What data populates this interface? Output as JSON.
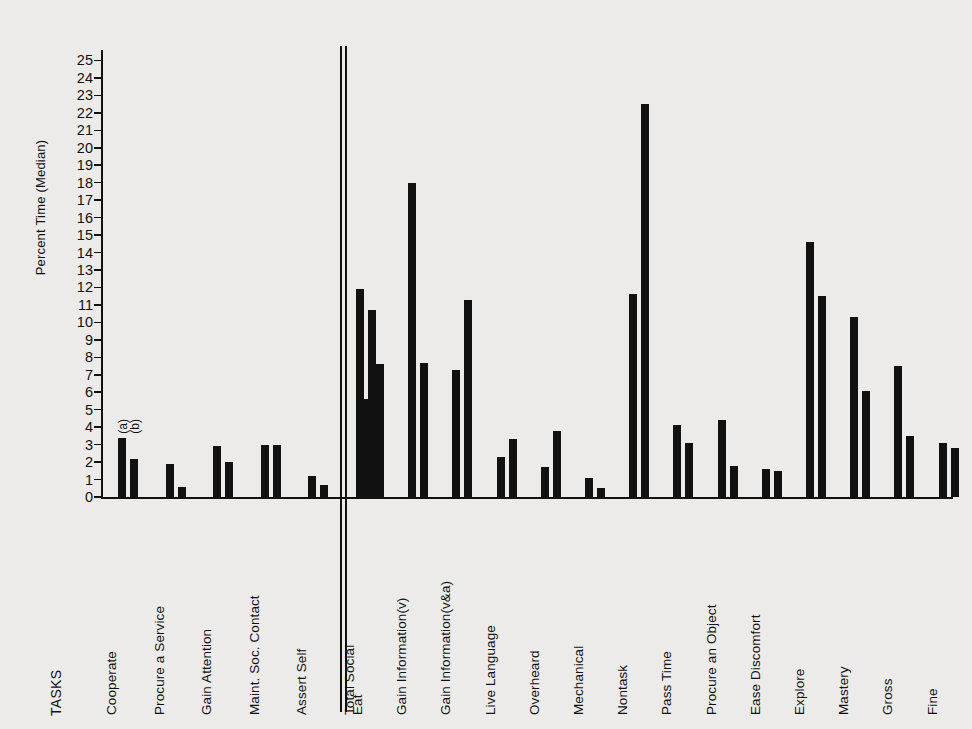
{
  "chart_data": {
    "type": "bar",
    "title": "",
    "xlabel": "TASKS",
    "ylabel": "Percent Time (Median)",
    "ylim": [
      0,
      25.6
    ],
    "ytick_labels": [
      "0",
      "1",
      "2",
      "3",
      "4",
      "5",
      "6",
      "7",
      "8",
      "9",
      "10",
      "11",
      "12",
      "13",
      "14",
      "15",
      "16",
      "17",
      "18",
      "19",
      "20",
      "21",
      "22",
      "23",
      "24",
      "25"
    ],
    "ytick_values": [
      0,
      1,
      2,
      3,
      4,
      5,
      6,
      7,
      8,
      9,
      10,
      11,
      12,
      13,
      14,
      15,
      16,
      17,
      18,
      19,
      20,
      21,
      22,
      23,
      24,
      25
    ],
    "grid": false,
    "legend_position": "inline-above-first-group",
    "series_markers": [
      "(a)",
      "(b)"
    ],
    "categories": [
      "Cooperate",
      "Procure a Service",
      "Gain Attention",
      "Maint. Soc. Contact",
      "Assert Self",
      "Total Social",
      "Eat",
      "Gain Information(v)",
      "Gain Information(v&a)",
      "Live Language",
      "Overheard",
      "Mechanical",
      "Nontask",
      "Pass Time",
      "Procure an Object",
      "Ease Discomfort",
      "Explore",
      "Mastery",
      "Gross",
      "Fine"
    ],
    "series": [
      {
        "name": "(a)",
        "values": [
          3.4,
          1.9,
          2.9,
          3.0,
          1.2,
          11.9,
          5.6,
          18.0,
          7.3,
          2.3,
          1.7,
          1.1,
          11.6,
          4.1,
          4.4,
          1.6,
          14.6,
          10.3,
          7.5,
          3.1
        ]
      },
      {
        "name": "(b)",
        "values": [
          2.2,
          0.6,
          2.0,
          3.0,
          0.7,
          10.7,
          7.6,
          7.7,
          11.3,
          3.3,
          3.8,
          0.5,
          22.5,
          3.1,
          1.8,
          1.5,
          11.5,
          6.1,
          3.5,
          2.8
        ]
      }
    ],
    "divider_after_category": "Total Social",
    "divider_note": "double vertical rule separating social tasks from nonsocial tasks"
  }
}
